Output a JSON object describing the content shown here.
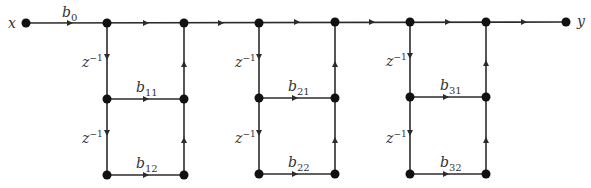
{
  "diagram": {
    "type": "signal-flow-graph",
    "input": {
      "label": "x"
    },
    "output": {
      "label": "y"
    },
    "gain": {
      "base": "b",
      "sub": "0"
    },
    "delay": {
      "base": "z",
      "sup": "−1"
    },
    "sections": [
      {
        "id": 1,
        "coeffs": [
          {
            "base": "b",
            "sub": "11"
          },
          {
            "base": "b",
            "sub": "12"
          }
        ]
      },
      {
        "id": 2,
        "coeffs": [
          {
            "base": "b",
            "sub": "21"
          },
          {
            "base": "b",
            "sub": "22"
          }
        ]
      },
      {
        "id": 3,
        "coeffs": [
          {
            "base": "b",
            "sub": "31"
          },
          {
            "base": "b",
            "sub": "32"
          }
        ]
      }
    ],
    "colors": {
      "line": "#2b2b2b",
      "node": "#111111",
      "text": "#333333"
    }
  }
}
